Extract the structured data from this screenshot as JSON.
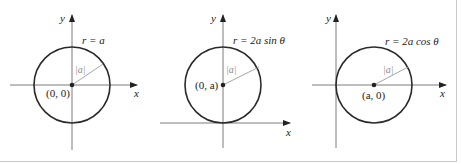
{
  "colors": {
    "axis": "#6e6e6e",
    "circle": "#2a2a2a",
    "radius_line": "#9a9a9a",
    "text": "#222222",
    "radius_label": "#8a8a8a",
    "frame": "#c8c8c8"
  },
  "panels": [
    {
      "equation": "r = a",
      "center_label": "(0, 0)",
      "radius_label": "|a|",
      "x_axis_label": "x",
      "y_axis_label": "y"
    },
    {
      "equation": "r = 2a sin θ",
      "center_label": "(0, a)",
      "radius_label": "|a|",
      "x_axis_label": "x",
      "y_axis_label": "y"
    },
    {
      "equation": "r = 2a cos θ",
      "center_label": "(a, 0)",
      "radius_label": "|a|",
      "x_axis_label": "x",
      "y_axis_label": "y"
    }
  ]
}
